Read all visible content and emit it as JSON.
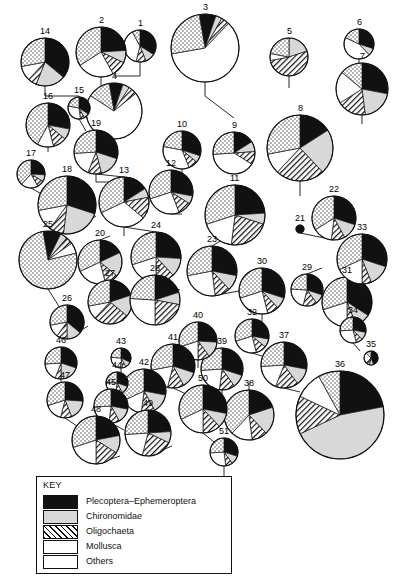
{
  "figure": {
    "title": "",
    "width": 402,
    "height": 582,
    "background": "#ffffff",
    "stroke": "#111111"
  },
  "key": {
    "title": "KEY",
    "items": [
      {
        "label": "Plecoptera–Ephemeroptera",
        "pattern": "black",
        "color": "#111111",
        "swatch_name": "swatch-plecoptera-ephemeroptera"
      },
      {
        "label": "Chironomidae",
        "pattern": "grey",
        "color": "#d8d8d8",
        "swatch_name": "swatch-chironomidae"
      },
      {
        "label": "Oligochaeta",
        "pattern": "hatch",
        "color": "#ffffff",
        "swatch_name": "swatch-oligochaeta"
      },
      {
        "label": "Mollusca",
        "pattern": "white",
        "color": "#ffffff",
        "swatch_name": "swatch-mollusca"
      },
      {
        "label": "Others",
        "pattern": "dots",
        "color": "#ffffff",
        "swatch_name": "swatch-others"
      }
    ]
  },
  "chart_data": {
    "type": "pie",
    "title": "",
    "subtitle": "",
    "xlabel": "",
    "ylabel": "",
    "legend_position": "bottom-left",
    "grid": false,
    "categories": [
      "Plecoptera–Ephemeroptera",
      "Chironomidae",
      "Oligochaeta",
      "Mollusca",
      "Others"
    ],
    "patterns": [
      "black",
      "grey",
      "hatch",
      "white",
      "dots"
    ],
    "value_unit": "percent",
    "note": "Each pie is a sampling site; radius scales with total abundance. start_angle is degrees clockwise from 12 o'clock.",
    "pies": [
      {
        "id": "1",
        "label": "1",
        "cx": 140,
        "cy": 46,
        "r": 16,
        "start_angle": 0,
        "values": [
          34,
          10,
          10,
          38,
          8
        ]
      },
      {
        "id": "2",
        "label": "2",
        "cx": 101,
        "cy": 52,
        "r": 25,
        "start_angle": 0,
        "values": [
          24,
          8,
          10,
          24,
          34
        ]
      },
      {
        "id": "3",
        "label": "3",
        "cx": 205,
        "cy": 48,
        "r": 34,
        "start_angle": 350,
        "values": [
          8,
          3,
          4,
          60,
          25
        ]
      },
      {
        "id": "4",
        "label": "4",
        "cx": 114,
        "cy": 111,
        "r": 28,
        "start_angle": 350,
        "values": [
          8,
          4,
          5,
          70,
          13
        ]
      },
      {
        "id": "5",
        "label": "5",
        "cx": 289,
        "cy": 57,
        "r": 19,
        "start_angle": 0,
        "values": [
          0,
          20,
          52,
          6,
          22
        ]
      },
      {
        "id": "6",
        "label": "6",
        "cx": 359,
        "cy": 44,
        "r": 15,
        "start_angle": 0,
        "values": [
          30,
          8,
          0,
          44,
          18
        ]
      },
      {
        "id": "7",
        "label": "7",
        "cx": 362,
        "cy": 89,
        "r": 26,
        "start_angle": 0,
        "values": [
          28,
          20,
          18,
          20,
          14
        ]
      },
      {
        "id": "8",
        "label": "8",
        "cx": 300,
        "cy": 148,
        "r": 33,
        "start_angle": 0,
        "values": [
          16,
          22,
          24,
          10,
          28
        ]
      },
      {
        "id": "9",
        "label": "9",
        "cx": 234,
        "cy": 153,
        "r": 21,
        "start_angle": 0,
        "values": [
          16,
          8,
          10,
          40,
          26
        ]
      },
      {
        "id": "10",
        "label": "10",
        "cx": 182,
        "cy": 150,
        "r": 19,
        "start_angle": 0,
        "values": [
          30,
          6,
          8,
          34,
          22
        ]
      },
      {
        "id": "11",
        "label": "11",
        "cx": 235,
        "cy": 215,
        "r": 30,
        "start_angle": 0,
        "values": [
          24,
          6,
          22,
          18,
          30
        ]
      },
      {
        "id": "12",
        "label": "12",
        "cx": 171,
        "cy": 192,
        "r": 22,
        "start_angle": 0,
        "values": [
          28,
          6,
          10,
          26,
          30
        ]
      },
      {
        "id": "13",
        "label": "13",
        "cx": 124,
        "cy": 202,
        "r": 25,
        "start_angle": 0,
        "values": [
          16,
          6,
          14,
          32,
          32
        ]
      },
      {
        "id": "14",
        "label": "14",
        "cx": 45,
        "cy": 62,
        "r": 24,
        "start_angle": 0,
        "values": [
          36,
          20,
          6,
          10,
          28
        ]
      },
      {
        "id": "15",
        "label": "15",
        "cx": 79,
        "cy": 108,
        "r": 11,
        "start_angle": 0,
        "values": [
          34,
          8,
          6,
          30,
          22
        ]
      },
      {
        "id": "16",
        "label": "16",
        "cx": 48,
        "cy": 125,
        "r": 22,
        "start_angle": 0,
        "values": [
          28,
          8,
          10,
          12,
          42
        ]
      },
      {
        "id": "17",
        "label": "17",
        "cx": 31,
        "cy": 174,
        "r": 14,
        "start_angle": 0,
        "values": [
          26,
          8,
          8,
          20,
          38
        ]
      },
      {
        "id": "18",
        "label": "18",
        "cx": 67,
        "cy": 205,
        "r": 29,
        "start_angle": 0,
        "values": [
          30,
          22,
          8,
          12,
          28
        ]
      },
      {
        "id": "19",
        "label": "19",
        "cx": 96,
        "cy": 152,
        "r": 22,
        "start_angle": 0,
        "values": [
          30,
          16,
          10,
          18,
          26
        ]
      },
      {
        "id": "20",
        "label": "20",
        "cx": 100,
        "cy": 262,
        "r": 22,
        "start_angle": 0,
        "values": [
          18,
          18,
          10,
          22,
          32
        ]
      },
      {
        "id": "21",
        "label": "21",
        "cx": 300,
        "cy": 229,
        "r": 4,
        "start_angle": 0,
        "values": [
          100,
          0,
          0,
          0,
          0
        ]
      },
      {
        "id": "22",
        "label": "22",
        "cx": 334,
        "cy": 218,
        "r": 22,
        "start_angle": 0,
        "values": [
          30,
          12,
          10,
          14,
          34
        ]
      },
      {
        "id": "23",
        "label": "23",
        "cx": 212,
        "cy": 271,
        "r": 25,
        "start_angle": 0,
        "values": [
          28,
          10,
          10,
          24,
          28
        ]
      },
      {
        "id": "24",
        "label": "24",
        "cx": 156,
        "cy": 257,
        "r": 25,
        "start_angle": 0,
        "values": [
          26,
          12,
          12,
          20,
          30
        ]
      },
      {
        "id": "25",
        "label": "25",
        "cx": 48,
        "cy": 260,
        "r": 29,
        "start_angle": 350,
        "values": [
          10,
          4,
          4,
          6,
          76
        ]
      },
      {
        "id": "26",
        "label": "26",
        "cx": 67,
        "cy": 322,
        "r": 17,
        "start_angle": 0,
        "values": [
          36,
          14,
          10,
          12,
          28
        ]
      },
      {
        "id": "27",
        "label": "27",
        "cx": 110,
        "cy": 302,
        "r": 22,
        "start_angle": 0,
        "values": [
          20,
          16,
          26,
          10,
          28
        ]
      },
      {
        "id": "28",
        "label": "28",
        "cx": 155,
        "cy": 300,
        "r": 25,
        "start_angle": 0,
        "values": [
          20,
          8,
          22,
          26,
          24
        ]
      },
      {
        "id": "29",
        "label": "29",
        "cx": 307,
        "cy": 290,
        "r": 16,
        "start_angle": 0,
        "values": [
          30,
          10,
          14,
          22,
          24
        ]
      },
      {
        "id": "30",
        "label": "30",
        "cx": 262,
        "cy": 291,
        "r": 23,
        "start_angle": 0,
        "values": [
          30,
          8,
          8,
          24,
          30
        ]
      },
      {
        "id": "31",
        "label": "31",
        "cx": 347,
        "cy": 302,
        "r": 25,
        "start_angle": 0,
        "values": [
          34,
          10,
          6,
          20,
          30
        ]
      },
      {
        "id": "32",
        "label": "32",
        "cx": 252,
        "cy": 336,
        "r": 17,
        "start_angle": 0,
        "values": [
          28,
          8,
          10,
          24,
          30
        ]
      },
      {
        "id": "33",
        "label": "33",
        "cx": 362,
        "cy": 259,
        "r": 25,
        "start_angle": 0,
        "values": [
          30,
          14,
          6,
          18,
          32
        ]
      },
      {
        "id": "34",
        "label": "34",
        "cx": 353,
        "cy": 330,
        "r": 13,
        "start_angle": 0,
        "values": [
          28,
          10,
          8,
          28,
          26
        ]
      },
      {
        "id": "35",
        "label": "35",
        "cx": 371,
        "cy": 358,
        "r": 7,
        "start_angle": 0,
        "values": [
          44,
          10,
          8,
          26,
          12
        ]
      },
      {
        "id": "36",
        "label": "36",
        "cx": 340,
        "cy": 415,
        "r": 44,
        "start_angle": 0,
        "values": [
          22,
          46,
          14,
          10,
          8
        ]
      },
      {
        "id": "37",
        "label": "37",
        "cx": 284,
        "cy": 365,
        "r": 23,
        "start_angle": 0,
        "values": [
          28,
          12,
          16,
          18,
          26
        ]
      },
      {
        "id": "38",
        "label": "38",
        "cx": 249,
        "cy": 415,
        "r": 25,
        "start_angle": 0,
        "values": [
          20,
          18,
          10,
          14,
          38
        ]
      },
      {
        "id": "39",
        "label": "39",
        "cx": 222,
        "cy": 369,
        "r": 21,
        "start_angle": 0,
        "values": [
          30,
          10,
          12,
          22,
          26
        ]
      },
      {
        "id": "40",
        "label": "40",
        "cx": 198,
        "cy": 341,
        "r": 19,
        "start_angle": 0,
        "values": [
          26,
          14,
          10,
          20,
          30
        ]
      },
      {
        "id": "41",
        "label": "41",
        "cx": 173,
        "cy": 366,
        "r": 22,
        "start_angle": 0,
        "values": [
          30,
          12,
          12,
          18,
          28
        ]
      },
      {
        "id": "42",
        "label": "42",
        "cx": 144,
        "cy": 391,
        "r": 22,
        "start_angle": 0,
        "values": [
          28,
          14,
          10,
          16,
          32
        ]
      },
      {
        "id": "43",
        "label": "43",
        "cx": 121,
        "cy": 358,
        "r": 10,
        "start_angle": 0,
        "values": [
          32,
          10,
          6,
          28,
          24
        ]
      },
      {
        "id": "44",
        "label": "44",
        "cx": 117,
        "cy": 383,
        "r": 11,
        "start_angle": 0,
        "values": [
          30,
          12,
          10,
          24,
          24
        ]
      },
      {
        "id": "45",
        "label": "45",
        "cx": 111,
        "cy": 406,
        "r": 17,
        "start_angle": 0,
        "values": [
          28,
          14,
          10,
          22,
          26
        ]
      },
      {
        "id": "46",
        "label": "46",
        "cx": 61,
        "cy": 363,
        "r": 16,
        "start_angle": 0,
        "values": [
          30,
          20,
          6,
          18,
          26
        ]
      },
      {
        "id": "47",
        "label": "47",
        "cx": 65,
        "cy": 400,
        "r": 18,
        "start_angle": 0,
        "values": [
          26,
          18,
          10,
          16,
          30
        ]
      },
      {
        "id": "48",
        "label": "48",
        "cx": 96,
        "cy": 440,
        "r": 24,
        "start_angle": 0,
        "values": [
          22,
          12,
          16,
          20,
          30
        ]
      },
      {
        "id": "49",
        "label": "49",
        "cx": 148,
        "cy": 433,
        "r": 23,
        "start_angle": 0,
        "values": [
          24,
          8,
          22,
          20,
          26
        ]
      },
      {
        "id": "50",
        "label": "50",
        "cx": 203,
        "cy": 409,
        "r": 24,
        "start_angle": 0,
        "values": [
          28,
          10,
          12,
          18,
          32
        ]
      },
      {
        "id": "51",
        "label": "51",
        "cx": 224,
        "cy": 452,
        "r": 14,
        "start_angle": 0,
        "values": [
          30,
          10,
          8,
          26,
          26
        ]
      }
    ],
    "connectors": [
      [
        45,
        86,
        45,
        96
      ],
      [
        45,
        96,
        79,
        96
      ],
      [
        79,
        96,
        79,
        100
      ],
      [
        79,
        119,
        86,
        131
      ],
      [
        48,
        147,
        48,
        152
      ],
      [
        31,
        188,
        45,
        196
      ],
      [
        96,
        174,
        96,
        182
      ],
      [
        96,
        182,
        114,
        182
      ],
      [
        114,
        139,
        114,
        150
      ],
      [
        140,
        62,
        140,
        76
      ],
      [
        140,
        76,
        114,
        76
      ],
      [
        101,
        77,
        101,
        88
      ],
      [
        96,
        174,
        124,
        177
      ],
      [
        124,
        227,
        124,
        236
      ],
      [
        67,
        234,
        96,
        216
      ],
      [
        100,
        240,
        110,
        236
      ],
      [
        100,
        284,
        110,
        292
      ],
      [
        48,
        289,
        60,
        308
      ],
      [
        67,
        339,
        88,
        326
      ],
      [
        110,
        324,
        124,
        320
      ],
      [
        132,
        300,
        155,
        300
      ],
      [
        124,
        227,
        156,
        232
      ],
      [
        156,
        282,
        180,
        290
      ],
      [
        182,
        169,
        182,
        178
      ],
      [
        171,
        214,
        182,
        214
      ],
      [
        205,
        82,
        205,
        96
      ],
      [
        205,
        96,
        234,
        118
      ],
      [
        234,
        132,
        234,
        132
      ],
      [
        212,
        246,
        222,
        240
      ],
      [
        212,
        296,
        239,
        291
      ],
      [
        262,
        314,
        262,
        322
      ],
      [
        252,
        353,
        262,
        356
      ],
      [
        284,
        342,
        284,
        348
      ],
      [
        300,
        181,
        300,
        196
      ],
      [
        289,
        76,
        289,
        88
      ],
      [
        307,
        274,
        322,
        268
      ],
      [
        300,
        233,
        334,
        240
      ],
      [
        334,
        196,
        334,
        200
      ],
      [
        322,
        302,
        347,
        302
      ],
      [
        347,
        327,
        353,
        327
      ],
      [
        353,
        343,
        360,
        351
      ],
      [
        359,
        59,
        359,
        63
      ],
      [
        362,
        115,
        362,
        124
      ],
      [
        362,
        284,
        362,
        292
      ],
      [
        340,
        371,
        340,
        378
      ],
      [
        284,
        388,
        300,
        392
      ],
      [
        249,
        390,
        249,
        382
      ],
      [
        222,
        390,
        222,
        398
      ],
      [
        198,
        360,
        198,
        368
      ],
      [
        173,
        388,
        186,
        394
      ],
      [
        144,
        413,
        160,
        404
      ],
      [
        121,
        368,
        121,
        372
      ],
      [
        117,
        394,
        117,
        398
      ],
      [
        111,
        423,
        124,
        430
      ],
      [
        61,
        379,
        61,
        388
      ],
      [
        65,
        418,
        80,
        428
      ],
      [
        96,
        464,
        120,
        456
      ],
      [
        148,
        456,
        172,
        446
      ],
      [
        203,
        433,
        214,
        442
      ],
      [
        224,
        466,
        224,
        478
      ]
    ],
    "flow_arrows": [
      {
        "x": 222,
        "y": 492,
        "dir": "down",
        "name": "outflow-arrow"
      }
    ]
  }
}
